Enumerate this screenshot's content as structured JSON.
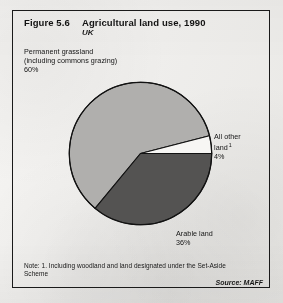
{
  "figure": {
    "number": "Figure 5.6",
    "title": "Agricultural land use, 1990",
    "subtitle": "UK"
  },
  "labels": {
    "grassland": "Permanent grassland\n(including commons grazing)\n60%",
    "grassland_line1": "Permanent grassland",
    "grassland_line2": "(including commons grazing)",
    "grassland_line3": "60%",
    "other_line1": "All other",
    "other_line2": "land",
    "other_footnote_marker": "1",
    "other_line3": "4%",
    "arable_line1": "Arable land",
    "arable_line2": "36%"
  },
  "footer": {
    "note": "Note: 1.  Including woodland and land designated under the Set-Aside Scheme",
    "source": "Source:  MAFF"
  },
  "colors": {
    "grassland": "#b0afad",
    "arable": "#545352",
    "other": "#f7f6f4",
    "outline": "#121212",
    "paper": "#f2f1ef"
  },
  "chart_data": {
    "type": "pie",
    "title": "Agricultural land use, 1990",
    "subtitle": "UK",
    "categories": [
      "Permanent grassland (including commons grazing)",
      "Arable land",
      "All other land"
    ],
    "values": [
      60,
      36,
      4
    ],
    "unit": "percent",
    "legend": "none",
    "labels_position": "external callouts",
    "slices": [
      {
        "name": "Permanent grassland (including commons grazing)",
        "value": 60,
        "color": "#b0afad",
        "start_deg": 14.4,
        "end_deg": 230.4
      },
      {
        "name": "Arable land",
        "value": 36,
        "color": "#545352",
        "start_deg": 230.4,
        "end_deg": 360
      },
      {
        "name": "All other land",
        "value": 4,
        "color": "#f7f6f4",
        "start_deg": 0,
        "end_deg": 14.4
      }
    ],
    "note": "Note: 1.  Including woodland and land designated under the Set-Aside Scheme",
    "source": "Source:  MAFF"
  }
}
